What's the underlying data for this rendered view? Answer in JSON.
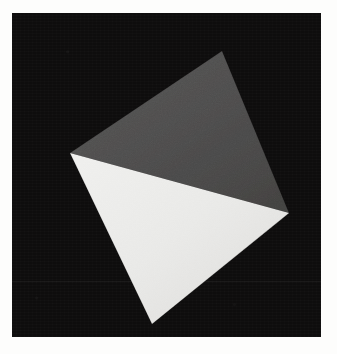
{
  "image": {
    "title": "Shaded 3D polyhedron render",
    "width": 337,
    "height": 354,
    "background_color": "#ffffff",
    "canvas": {
      "x": 12,
      "y": 13,
      "width": 309,
      "height": 324,
      "color": "#0d0c0c"
    }
  },
  "scene": {
    "object_name": "tetrahedron",
    "description": "Shaded convex polyhedron rendered on a black background",
    "lighting": "single light from upper left",
    "vertices": {
      "apex": {
        "x": 210,
        "y": 38,
        "label": "top"
      },
      "left": {
        "x": 58,
        "y": 140,
        "label": "left"
      },
      "right": {
        "x": 277,
        "y": 200,
        "label": "right"
      },
      "bottom": {
        "x": 140,
        "y": 311,
        "label": "bottom"
      }
    },
    "faces": [
      {
        "name": "upper-face",
        "color": "#4d4c4c",
        "shade": "dark-gray",
        "points": "210,38 58,140 277,200"
      },
      {
        "name": "front-face",
        "color": "#e9e9e7",
        "shade": "near-white",
        "points": "58,140 277,200 140,311"
      },
      {
        "name": "right-sliver-face",
        "color": "#b9b8b5",
        "shade": "mid-gray",
        "points": "277,200 268,207 140,311"
      }
    ],
    "edges": [
      {
        "name": "apex-to-left",
        "from": "apex",
        "to": "left"
      },
      {
        "name": "apex-to-right",
        "from": "apex",
        "to": "right"
      },
      {
        "name": "left-to-right",
        "from": "left",
        "to": "right"
      },
      {
        "name": "left-to-bottom",
        "from": "left",
        "to": "bottom"
      },
      {
        "name": "right-to-bottom",
        "from": "right",
        "to": "bottom"
      }
    ]
  },
  "palette": {
    "background": "#0d0c0c",
    "paper": "#fdfdfc",
    "face_dark": "#4d4c4c",
    "face_light": "#e9e9e7",
    "face_mid": "#b9b8b5"
  }
}
